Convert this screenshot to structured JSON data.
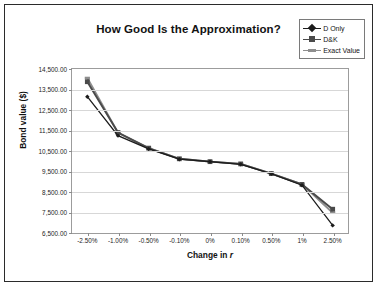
{
  "chart_data": {
    "type": "line",
    "title": "How Good Is the Approximation?",
    "xlabel": "Change in r",
    "xlabel_prefix": "Change in ",
    "xlabel_italic": "r",
    "ylabel": "Bond value ($)",
    "categories": [
      "-2.50%",
      "-1.00%",
      "-0.50%",
      "-0.10%",
      "0%",
      "0.10%",
      "0.50%",
      "1%",
      "2.50%"
    ],
    "ylim": [
      6500,
      14500
    ],
    "ytick_values": [
      6500,
      7500,
      8500,
      9500,
      10500,
      11500,
      12500,
      13500,
      14500
    ],
    "ytick_labels": [
      "6,500.00",
      "7,500.00",
      "8,500.00",
      "9,500.00",
      "10,500.00",
      "11,500.00",
      "12,500.00",
      "13,500.00",
      "14,500.00"
    ],
    "grid": true,
    "legend_position": "top-right",
    "series": [
      {
        "name": "D Only",
        "color": "#1c1c1c",
        "marker": "diamond",
        "values": [
          13150,
          11250,
          10600,
          10100,
          9980,
          9850,
          9390,
          8830,
          6870
        ]
      },
      {
        "name": "D&K",
        "color": "#4a4a4a",
        "marker": "square",
        "values": [
          13880,
          11400,
          10640,
          10120,
          9980,
          9870,
          9400,
          8870,
          7660
        ]
      },
      {
        "name": "Exact Value",
        "color": "#8e8e8e",
        "marker": "dash",
        "values": [
          14060,
          11390,
          10640,
          10120,
          9980,
          9870,
          9400,
          8870,
          7490
        ]
      }
    ]
  },
  "legend": {
    "items": [
      {
        "label": "D Only"
      },
      {
        "label": "D&K"
      },
      {
        "label": "Exact Value"
      }
    ]
  }
}
